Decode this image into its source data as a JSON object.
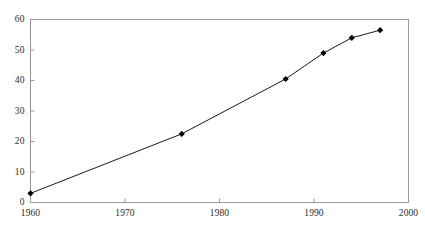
{
  "chart_data": {
    "type": "line",
    "title": "",
    "subtitle": "",
    "xlabel": "",
    "ylabel": "",
    "xlim": [
      1960,
      2000
    ],
    "ylim": [
      0,
      60
    ],
    "xticks": [
      1960,
      1970,
      1980,
      1990,
      2000
    ],
    "yticks": [
      0,
      10,
      20,
      30,
      40,
      50,
      60
    ],
    "xtick_labels": [
      "1960",
      "1970",
      "1980",
      "1990",
      "2000"
    ],
    "ytick_labels": [
      "0",
      "10",
      "20",
      "30",
      "40",
      "50",
      "60"
    ],
    "grid": false,
    "legend": null,
    "legend_position": "none",
    "annotations": [],
    "marker": "diamond",
    "marker_color": "#000000",
    "line_color": "#000000",
    "axis_color": "#999999",
    "x": [
      1960,
      1976,
      1987,
      1991,
      1994,
      1997
    ],
    "values": [
      3,
      22.5,
      40.5,
      49,
      54,
      56.5
    ],
    "series": [
      {
        "name": "",
        "x": [
          1960,
          1976,
          1987,
          1991,
          1994,
          1997
        ],
        "values": [
          3,
          22.5,
          40.5,
          49,
          54,
          56.5
        ]
      }
    ]
  },
  "axes": {
    "y": {
      "ticks": [
        {
          "label": "60",
          "value": 60
        },
        {
          "label": "50",
          "value": 50
        },
        {
          "label": "40",
          "value": 40
        },
        {
          "label": "30",
          "value": 30
        },
        {
          "label": "20",
          "value": 20
        },
        {
          "label": "10",
          "value": 10
        },
        {
          "label": "0",
          "value": 0
        }
      ]
    },
    "x": {
      "ticks": [
        {
          "label": "1960",
          "value": 1960
        },
        {
          "label": "1970",
          "value": 1970
        },
        {
          "label": "1980",
          "value": 1980
        },
        {
          "label": "1990",
          "value": 1990
        },
        {
          "label": "2000",
          "value": 2000
        }
      ]
    }
  },
  "colors": {
    "background": "#ffffff",
    "axis": "#999999",
    "text": "#2b2b2b",
    "series": "#000000"
  }
}
